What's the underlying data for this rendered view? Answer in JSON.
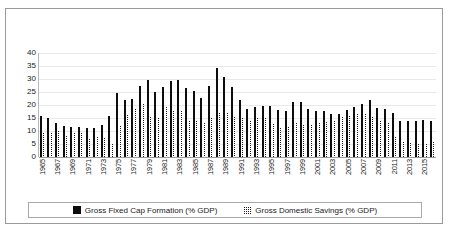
{
  "chart_data": {
    "type": "bar",
    "title": "",
    "xlabel": "",
    "ylabel": "",
    "ylim": [
      0,
      40
    ],
    "yticks": [
      0,
      5,
      10,
      15,
      20,
      25,
      30,
      35,
      40
    ],
    "grid": true,
    "legend_position": "bottom",
    "x": [
      1965,
      1966,
      1967,
      1968,
      1969,
      1970,
      1971,
      1972,
      1973,
      1974,
      1975,
      1976,
      1977,
      1978,
      1979,
      1980,
      1981,
      1982,
      1983,
      1984,
      1985,
      1986,
      1987,
      1988,
      1989,
      1990,
      1991,
      1992,
      1993,
      1994,
      1995,
      1996,
      1997,
      1998,
      1999,
      2000,
      2001,
      2002,
      2003,
      2004,
      2005,
      2006,
      2007,
      2008,
      2009,
      2010,
      2011,
      2012,
      2013,
      2014,
      2015,
      2016
    ],
    "xtick_labels": [
      "1965",
      "1967",
      "1969",
      "1971",
      "1973",
      "1975",
      "1977",
      "1979",
      "1981",
      "1983",
      "1985",
      "1987",
      "1989",
      "1991",
      "1993",
      "1995",
      "1997",
      "1999",
      "2001",
      "2003",
      "2005",
      "2007",
      "2009",
      "2011",
      "2013",
      "2015"
    ],
    "series": [
      {
        "name": "Gross Fixed Cap Formation (% GDP)",
        "pattern": "solid",
        "color": "#0d0d0d",
        "values": [
          15.8,
          15.1,
          13.1,
          12.0,
          11.6,
          11.5,
          11.2,
          11.3,
          12.4,
          15.7,
          24.5,
          22.0,
          22.2,
          27.4,
          29.7,
          24.9,
          26.8,
          29.3,
          29.6,
          26.5,
          25.2,
          22.6,
          27.4,
          34.2,
          30.6,
          26.8,
          22.1,
          18.6,
          19.4,
          19.5,
          19.6,
          17.9,
          17.8,
          21.2,
          21.3,
          18.6,
          17.8,
          17.6,
          16.5,
          16.7,
          17.9,
          19.2,
          20.5,
          22.1,
          19.0,
          18.5,
          16.9,
          14.0,
          14.0,
          14.0,
          14.4,
          14.0
        ]
      },
      {
        "name": "Gross Domestic Savings (% GDP)",
        "pattern": "checker",
        "color": "#1a1a1a",
        "values": [
          9.5,
          9.8,
          10.5,
          8.4,
          9.6,
          9.5,
          7.3,
          8.0,
          7.6,
          5.2,
          12.3,
          16.6,
          19.0,
          20.6,
          15.6,
          15.4,
          19.5,
          17.9,
          18.0,
          14.1,
          14.2,
          13.3,
          15.5,
          17.2,
          17.3,
          15.9,
          15.3,
          14.3,
          15.2,
          15.2,
          13.2,
          11.5,
          12.0,
          13.6,
          12.6,
          12.7,
          13.5,
          13.8,
          14.1,
          15.6,
          16.0,
          17.0,
          16.8,
          15.6,
          14.4,
          13.5,
          7.9,
          6.3,
          5.8,
          5.2,
          5.3,
          6.2
        ]
      }
    ]
  },
  "legend": {
    "entries": [
      {
        "label": "Gross Fixed Cap Formation (% GDP)",
        "swatch": "solid-black-square"
      },
      {
        "label": "Gross Domestic Savings (% GDP)",
        "swatch": "checkered-square"
      }
    ]
  }
}
